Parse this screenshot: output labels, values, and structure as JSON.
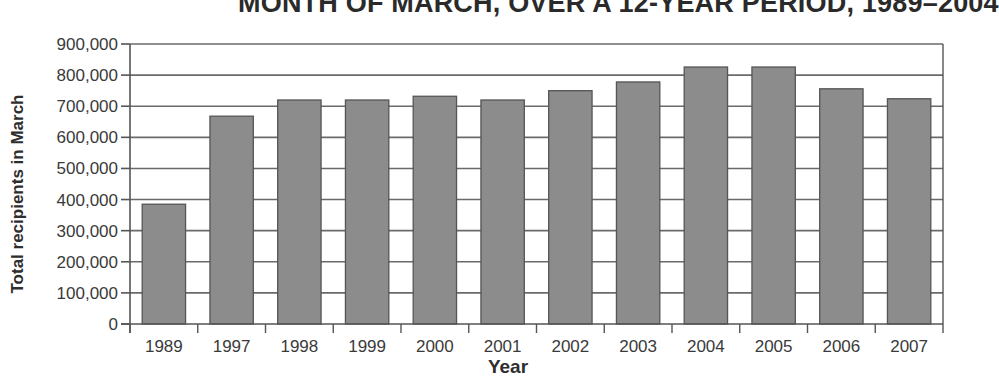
{
  "chart_data": {
    "type": "bar",
    "title": "MONTH OF MARCH, OVER A 12-YEAR PERIOD, 1989–2004",
    "xlabel": "Year",
    "ylabel": "Total recipients in March",
    "categories": [
      "1989",
      "1997",
      "1998",
      "1999",
      "2000",
      "2001",
      "2002",
      "2003",
      "2004",
      "2005",
      "2006",
      "2007"
    ],
    "values": [
      385000,
      668000,
      720000,
      720000,
      732000,
      720000,
      750000,
      778000,
      826000,
      826000,
      756000,
      724000
    ],
    "ylim": [
      0,
      900000
    ],
    "yticks": [
      0,
      100000,
      200000,
      300000,
      400000,
      500000,
      600000,
      700000,
      800000,
      900000
    ],
    "ytick_labels": [
      "0",
      "100,000",
      "200,000",
      "300,000",
      "400,000",
      "500,000",
      "600,000",
      "700,000",
      "800,000",
      "900,000"
    ],
    "grid": true,
    "legend": null
  },
  "colors": {
    "bar_fill": "#8c8c8c",
    "bar_stroke": "#555555",
    "grid": "#6a6a6a",
    "axis": "#555555"
  }
}
